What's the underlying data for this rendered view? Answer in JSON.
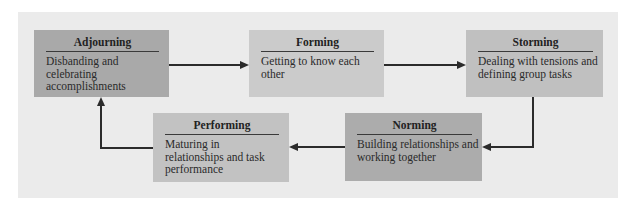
{
  "diagram": {
    "stages": [
      {
        "id": "adjourning",
        "title": "Adjourning",
        "description": "Disbanding and celebrating accomplishments",
        "color": "#a9a9a9"
      },
      {
        "id": "forming",
        "title": "Forming",
        "description": "Getting to know each other",
        "color": "#cbcbcb"
      },
      {
        "id": "storming",
        "title": "Storming",
        "description": "Dealing with tensions and defining group tasks",
        "color": "#c0c0c0"
      },
      {
        "id": "norming",
        "title": "Norming",
        "description": "Building relationships and working together",
        "color": "#acacac"
      },
      {
        "id": "performing",
        "title": "Performing",
        "description": "Maturing in relationships and task performance",
        "color": "#c2c2c2"
      }
    ],
    "flow": [
      "adjourning",
      "forming",
      "storming",
      "norming",
      "performing",
      "adjourning"
    ],
    "background": "#ebebeb"
  }
}
